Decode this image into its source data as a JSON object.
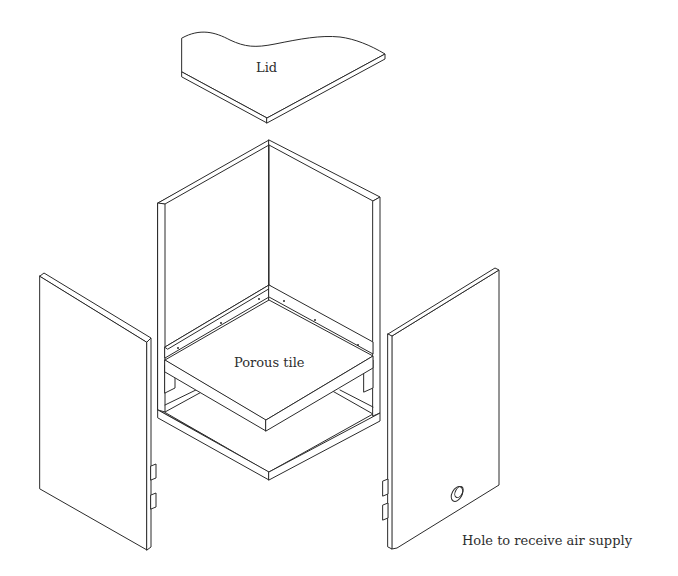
{
  "figure": {
    "type": "exploded isometric assembly drawing",
    "parts": [
      {
        "id": "lid",
        "label": "Lid"
      },
      {
        "id": "box-frame",
        "label": ""
      },
      {
        "id": "porous-tile",
        "label": "Porous tile"
      },
      {
        "id": "left-side-panel",
        "label": ""
      },
      {
        "id": "right-side-panel",
        "label": ""
      },
      {
        "id": "air-supply-hole",
        "label": "Hole to receive air supply"
      }
    ]
  },
  "labels": {
    "lid": "Lid",
    "porous_tile": "Porous tile",
    "air_hole": "Hole to receive air supply"
  },
  "colors": {
    "line": "#2b2b2b",
    "background": "#ffffff",
    "text": "#2e2e2e"
  }
}
